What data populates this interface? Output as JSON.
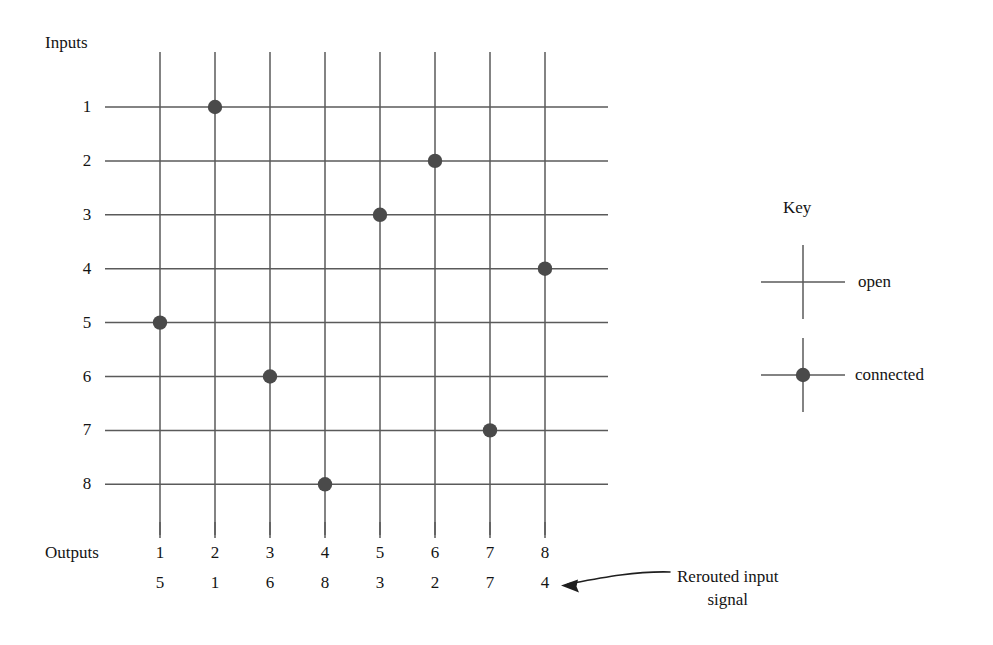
{
  "figure": {
    "inputs_label": "Inputs",
    "outputs_label": "Outputs",
    "key_title": "Key",
    "key_open_label": "open",
    "key_connected_label": "connected",
    "annotation_line1": "Rerouted input",
    "annotation_line2": "signal",
    "line_color": "#5a5a5a",
    "dot_color": "#4a4a4a",
    "text_color": "#141414",
    "background_color": "#ffffff"
  },
  "chart_data": {
    "type": "heatmap",
    "xlabel": "Outputs",
    "ylabel": "Inputs",
    "grid": true,
    "legend_position": "right",
    "x": [
      1,
      2,
      3,
      4,
      5,
      6,
      7,
      8
    ],
    "y": [
      1,
      2,
      3,
      4,
      5,
      6,
      7,
      8
    ],
    "row_labels": [
      "1",
      "2",
      "3",
      "4",
      "5",
      "6",
      "7",
      "8"
    ],
    "col_labels": [
      "1",
      "2",
      "3",
      "4",
      "5",
      "6",
      "7",
      "8"
    ],
    "rerouted_labels": [
      "5",
      "1",
      "6",
      "8",
      "3",
      "2",
      "7",
      "4"
    ],
    "series": [
      {
        "name": "connected",
        "points": [
          {
            "input": 1,
            "output": 2
          },
          {
            "input": 2,
            "output": 6
          },
          {
            "input": 3,
            "output": 5
          },
          {
            "input": 4,
            "output": 8
          },
          {
            "input": 5,
            "output": 1
          },
          {
            "input": 6,
            "output": 3
          },
          {
            "input": 7,
            "output": 7
          },
          {
            "input": 8,
            "output": 4
          }
        ]
      }
    ],
    "legend": [
      {
        "key": "open",
        "marker": "crossing"
      },
      {
        "key": "connected",
        "marker": "crossing-with-dot"
      }
    ]
  }
}
